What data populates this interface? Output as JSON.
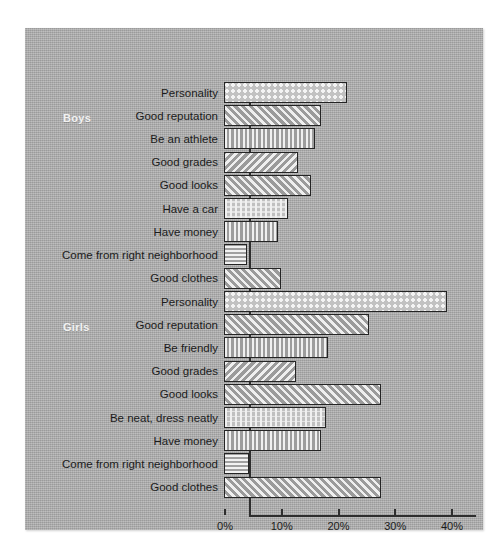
{
  "figure": {
    "background": "#ffffff",
    "panel_color": "#aaaaaa"
  },
  "groups": [
    {
      "key": "boys",
      "label": "Boys"
    },
    {
      "key": "girls",
      "label": "Girls"
    }
  ],
  "axis": {
    "tick_labels": [
      "0%",
      "10%",
      "20%",
      "30%",
      "40%"
    ],
    "tick_values": [
      0,
      10,
      20,
      30,
      40
    ],
    "min": 0,
    "max": 40
  },
  "chart_data": {
    "type": "bar",
    "orientation": "horizontal",
    "title": "",
    "xlabel": "",
    "ylabel": "",
    "xlim": [
      0,
      40
    ],
    "grid": false,
    "legend": "none",
    "xtick_labels": [
      "0%",
      "10%",
      "20%",
      "30%",
      "40%"
    ],
    "series": [
      {
        "name": "Boys",
        "categories": [
          "Personality",
          "Good reputation",
          "Be an athlete",
          "Good grades",
          "Good looks",
          "Have a car",
          "Have money",
          "Come from right neighborhood",
          "Good clothes"
        ],
        "values": [
          21.7,
          17.1,
          16.0,
          13.0,
          15.3,
          11.3,
          9.5,
          4.0,
          10.0
        ],
        "patterns": [
          "dots",
          "diag-up",
          "vert",
          "diag-down",
          "diag-up",
          "grid-dots",
          "vert",
          "horiz",
          "diag-up"
        ]
      },
      {
        "name": "Girls",
        "categories": [
          "Personality",
          "Good reputation",
          "Be friendly",
          "Good grades",
          "Good looks",
          "Be neat, dress neatly",
          "Have money",
          "Come from right neighborhood",
          "Good clothes"
        ],
        "values": [
          39.3,
          25.6,
          18.3,
          12.7,
          27.7,
          18.0,
          17.1,
          4.4,
          27.7
        ],
        "patterns": [
          "dots",
          "diag-up",
          "vert",
          "diag-down",
          "diag-up",
          "grid-dots",
          "vert",
          "horiz",
          "diag-up"
        ]
      }
    ]
  }
}
